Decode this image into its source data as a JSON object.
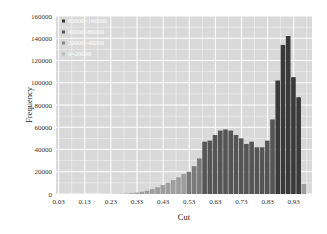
{
  "chart_data": {
    "type": "bar",
    "title": "",
    "xlabel": "Cut",
    "ylabel": "Frequency",
    "ylim": [
      0,
      160000
    ],
    "xlim": [
      0.02,
      1.0
    ],
    "grid": true,
    "legend_position": "upper-left",
    "y_ticks": [
      "0",
      "20000",
      "40000",
      "60000",
      "80000",
      "100000",
      "120000",
      "140000",
      "160000"
    ],
    "x_ticks": [
      "0.03",
      "0.13",
      "0.23",
      "0.33",
      "0.43",
      "0.53",
      "0.63",
      "0.73",
      "0.83",
      "0.93"
    ],
    "legend": [
      {
        "label": "80000~160000",
        "color": "#333333"
      },
      {
        "label": "40000~80000",
        "color": "#555555"
      },
      {
        "label": "20000~40000",
        "color": "#888888"
      },
      {
        "label": "0~20000",
        "color": "#bbbbbb"
      }
    ],
    "bin_width": 0.02,
    "categories": [
      "0.02",
      "0.04",
      "0.06",
      "0.08",
      "0.10",
      "0.12",
      "0.14",
      "0.16",
      "0.18",
      "0.20",
      "0.22",
      "0.24",
      "0.26",
      "0.28",
      "0.30",
      "0.32",
      "0.34",
      "0.36",
      "0.38",
      "0.40",
      "0.42",
      "0.44",
      "0.46",
      "0.48",
      "0.50",
      "0.52",
      "0.54",
      "0.56",
      "0.58",
      "0.60",
      "0.62",
      "0.64",
      "0.66",
      "0.68",
      "0.70",
      "0.72",
      "0.74",
      "0.76",
      "0.78",
      "0.80",
      "0.82",
      "0.84",
      "0.86",
      "0.88",
      "0.90",
      "0.92",
      "0.94",
      "0.96",
      "0.98"
    ],
    "values": [
      0,
      0,
      0,
      0,
      0,
      0,
      0,
      0,
      0,
      0,
      100,
      200,
      300,
      500,
      800,
      1200,
      2000,
      3000,
      4500,
      6000,
      8000,
      10000,
      12500,
      15000,
      18000,
      20000,
      25000,
      32000,
      47000,
      48000,
      53000,
      57000,
      58000,
      57000,
      53000,
      50000,
      45000,
      47000,
      42000,
      42000,
      48000,
      67000,
      102000,
      134000,
      142000,
      105000,
      87000,
      9000,
      0
    ]
  },
  "axes": {
    "xlabel": "Cut",
    "ylabel": "Frequency"
  }
}
